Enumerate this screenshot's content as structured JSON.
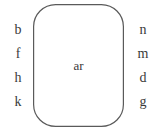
{
  "diagram": {
    "type": "word-family-diagram",
    "nucleus": {
      "label": "ar"
    },
    "left_column": {
      "name": "onset-letters",
      "items": [
        {
          "label": "b"
        },
        {
          "label": "f"
        },
        {
          "label": "h"
        },
        {
          "label": "k"
        }
      ]
    },
    "right_column": {
      "name": "coda-letters",
      "items": [
        {
          "label": "n"
        },
        {
          "label": "m"
        },
        {
          "label": "d"
        },
        {
          "label": "g"
        }
      ]
    },
    "shape": {
      "name": "rounded-rectangle",
      "stroke_color": "#5a5a5a",
      "fill_color": "#ffffff",
      "corner_radius": 22
    },
    "background_color": "#ffffff",
    "text_color": "#3a3a3a"
  }
}
